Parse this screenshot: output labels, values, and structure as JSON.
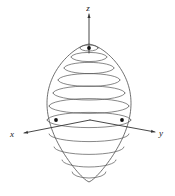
{
  "figure": {
    "kind": "3d-surface-diagram",
    "background_color": "#ffffff",
    "line_color": "#555555",
    "outline_color": "#4a4a4a",
    "axis_color": "#333333",
    "marker_color": "#111111"
  },
  "axes": {
    "z": {
      "label": "z",
      "label_x": 88,
      "label_y": 11,
      "direction": "up",
      "has_arrow": true,
      "start_x": 89,
      "start_y": 53,
      "end_x": 89,
      "end_y": 14
    },
    "x": {
      "label": "x",
      "label_x": 12,
      "label_y": 137,
      "direction": "down-left",
      "has_arrow": true,
      "start_x": 90,
      "start_y": 120,
      "end_x": 24,
      "end_y": 133
    },
    "y": {
      "label": "y",
      "label_x": 161,
      "label_y": 136,
      "direction": "down-right",
      "has_arrow": true,
      "start_x": 90,
      "start_y": 120,
      "end_x": 155,
      "end_y": 132
    }
  },
  "surface": {
    "shape": "ovoid",
    "center_x": 89,
    "center_y": 113,
    "half_width": 42,
    "top_y": 44,
    "bottom_y": 182,
    "top_pole_x": 89,
    "top_pole_y": 48
  },
  "markers": [
    {
      "name": "top-pole-point",
      "x": 89,
      "y": 48
    },
    {
      "name": "x-axis-surface-point",
      "x": 56,
      "y": 120
    },
    {
      "name": "y-axis-surface-point",
      "x": 122,
      "y": 120
    }
  ],
  "level_curves": {
    "count": 11,
    "description": "horizontal cross-section ellipses drawn at evenly spaced heights",
    "note": "upper curves are drawn as front arcs, lower curves bow downward"
  },
  "chart_data": {
    "type": "line",
    "xlabel": "x",
    "ylabel": "y",
    "zlabel": "z",
    "legend": [],
    "grid": false,
    "series": [
      {
        "name": "level-curve-1",
        "height_fraction": 0.02,
        "rx": 9,
        "ry": 3.0,
        "cy": 48
      },
      {
        "name": "level-curve-2",
        "height_fraction": 0.09,
        "rx": 18,
        "ry": 4.6,
        "cy": 57
      },
      {
        "name": "level-curve-3",
        "height_fraction": 0.17,
        "rx": 25,
        "ry": 5.6,
        "cy": 68
      },
      {
        "name": "level-curve-4",
        "height_fraction": 0.26,
        "rx": 31,
        "ry": 6.4,
        "cy": 80
      },
      {
        "name": "level-curve-5",
        "height_fraction": 0.36,
        "rx": 36,
        "ry": 7.0,
        "cy": 93
      },
      {
        "name": "level-curve-6",
        "height_fraction": 0.46,
        "rx": 40,
        "ry": 7.4,
        "cy": 106
      },
      {
        "name": "level-curve-7",
        "height_fraction": 0.57,
        "rx": 42,
        "ry": 7.6,
        "cy": 120
      },
      {
        "name": "level-curve-8",
        "height_fraction": 0.68,
        "rx": 40,
        "ry": 7.6,
        "cy": 134
      },
      {
        "name": "level-curve-9",
        "height_fraction": 0.78,
        "rx": 35,
        "ry": 7.4,
        "cy": 147
      },
      {
        "name": "level-curve-10",
        "height_fraction": 0.88,
        "rx": 27,
        "ry": 7.0,
        "cy": 160
      },
      {
        "name": "level-curve-11",
        "height_fraction": 0.96,
        "rx": 17,
        "ry": 6.0,
        "cy": 172
      }
    ]
  }
}
